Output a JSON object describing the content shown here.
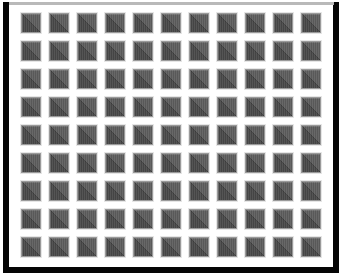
{
  "figure": {
    "canvas": {
      "width": 344,
      "height": 278,
      "background_color": "#ffffff"
    },
    "frame": {
      "name": "outer-border",
      "color": "#050505",
      "thickness_px": 6,
      "top_thickness_px": 3,
      "inset_left_px": 3,
      "inset_top_px": 2
    },
    "plate": {
      "name": "inner-plate",
      "background_color": "#ffffff"
    }
  },
  "grid": {
    "columns": 11,
    "rows": 9,
    "tile_count": 99,
    "tile_size_px": 18,
    "gap_px": 10,
    "pitch_px": 28,
    "origin_x_px": 22,
    "origin_y_px": 14
  },
  "tile": {
    "name": "diagonal-split-square",
    "shape": "square",
    "diagonal_direction": "bottom-left-to-top-right",
    "upper_left_color": "#5d5d5d",
    "lower_right_color": "#484848",
    "diagonal_line_color": "#3d3d3d",
    "outline_color": "#9a9a9a",
    "halo_color": "#e6e6e6",
    "texture": "faint-vertical-stripes"
  },
  "tiles": [
    {
      "row": 1,
      "col": 1
    },
    {
      "row": 1,
      "col": 2
    },
    {
      "row": 1,
      "col": 3
    },
    {
      "row": 1,
      "col": 4
    },
    {
      "row": 1,
      "col": 5
    },
    {
      "row": 1,
      "col": 6
    },
    {
      "row": 1,
      "col": 7
    },
    {
      "row": 1,
      "col": 8
    },
    {
      "row": 1,
      "col": 9
    },
    {
      "row": 1,
      "col": 10
    },
    {
      "row": 1,
      "col": 11
    },
    {
      "row": 2,
      "col": 1
    },
    {
      "row": 2,
      "col": 2
    },
    {
      "row": 2,
      "col": 3
    },
    {
      "row": 2,
      "col": 4
    },
    {
      "row": 2,
      "col": 5
    },
    {
      "row": 2,
      "col": 6
    },
    {
      "row": 2,
      "col": 7
    },
    {
      "row": 2,
      "col": 8
    },
    {
      "row": 2,
      "col": 9
    },
    {
      "row": 2,
      "col": 10
    },
    {
      "row": 2,
      "col": 11
    },
    {
      "row": 3,
      "col": 1
    },
    {
      "row": 3,
      "col": 2
    },
    {
      "row": 3,
      "col": 3
    },
    {
      "row": 3,
      "col": 4
    },
    {
      "row": 3,
      "col": 5
    },
    {
      "row": 3,
      "col": 6
    },
    {
      "row": 3,
      "col": 7
    },
    {
      "row": 3,
      "col": 8
    },
    {
      "row": 3,
      "col": 9
    },
    {
      "row": 3,
      "col": 10
    },
    {
      "row": 3,
      "col": 11
    },
    {
      "row": 4,
      "col": 1
    },
    {
      "row": 4,
      "col": 2
    },
    {
      "row": 4,
      "col": 3
    },
    {
      "row": 4,
      "col": 4
    },
    {
      "row": 4,
      "col": 5
    },
    {
      "row": 4,
      "col": 6
    },
    {
      "row": 4,
      "col": 7
    },
    {
      "row": 4,
      "col": 8
    },
    {
      "row": 4,
      "col": 9
    },
    {
      "row": 4,
      "col": 10
    },
    {
      "row": 4,
      "col": 11
    },
    {
      "row": 5,
      "col": 1
    },
    {
      "row": 5,
      "col": 2
    },
    {
      "row": 5,
      "col": 3
    },
    {
      "row": 5,
      "col": 4
    },
    {
      "row": 5,
      "col": 5
    },
    {
      "row": 5,
      "col": 6
    },
    {
      "row": 5,
      "col": 7
    },
    {
      "row": 5,
      "col": 8
    },
    {
      "row": 5,
      "col": 9
    },
    {
      "row": 5,
      "col": 10
    },
    {
      "row": 5,
      "col": 11
    },
    {
      "row": 6,
      "col": 1
    },
    {
      "row": 6,
      "col": 2
    },
    {
      "row": 6,
      "col": 3
    },
    {
      "row": 6,
      "col": 4
    },
    {
      "row": 6,
      "col": 5
    },
    {
      "row": 6,
      "col": 6
    },
    {
      "row": 6,
      "col": 7
    },
    {
      "row": 6,
      "col": 8
    },
    {
      "row": 6,
      "col": 9
    },
    {
      "row": 6,
      "col": 10
    },
    {
      "row": 6,
      "col": 11
    },
    {
      "row": 7,
      "col": 1
    },
    {
      "row": 7,
      "col": 2
    },
    {
      "row": 7,
      "col": 3
    },
    {
      "row": 7,
      "col": 4
    },
    {
      "row": 7,
      "col": 5
    },
    {
      "row": 7,
      "col": 6
    },
    {
      "row": 7,
      "col": 7
    },
    {
      "row": 7,
      "col": 8
    },
    {
      "row": 7,
      "col": 9
    },
    {
      "row": 7,
      "col": 10
    },
    {
      "row": 7,
      "col": 11
    },
    {
      "row": 8,
      "col": 1
    },
    {
      "row": 8,
      "col": 2
    },
    {
      "row": 8,
      "col": 3
    },
    {
      "row": 8,
      "col": 4
    },
    {
      "row": 8,
      "col": 5
    },
    {
      "row": 8,
      "col": 6
    },
    {
      "row": 8,
      "col": 7
    },
    {
      "row": 8,
      "col": 8
    },
    {
      "row": 8,
      "col": 9
    },
    {
      "row": 8,
      "col": 10
    },
    {
      "row": 8,
      "col": 11
    },
    {
      "row": 9,
      "col": 1
    },
    {
      "row": 9,
      "col": 2
    },
    {
      "row": 9,
      "col": 3
    },
    {
      "row": 9,
      "col": 4
    },
    {
      "row": 9,
      "col": 5
    },
    {
      "row": 9,
      "col": 6
    },
    {
      "row": 9,
      "col": 7
    },
    {
      "row": 9,
      "col": 8
    },
    {
      "row": 9,
      "col": 9
    },
    {
      "row": 9,
      "col": 10
    },
    {
      "row": 9,
      "col": 11
    }
  ]
}
